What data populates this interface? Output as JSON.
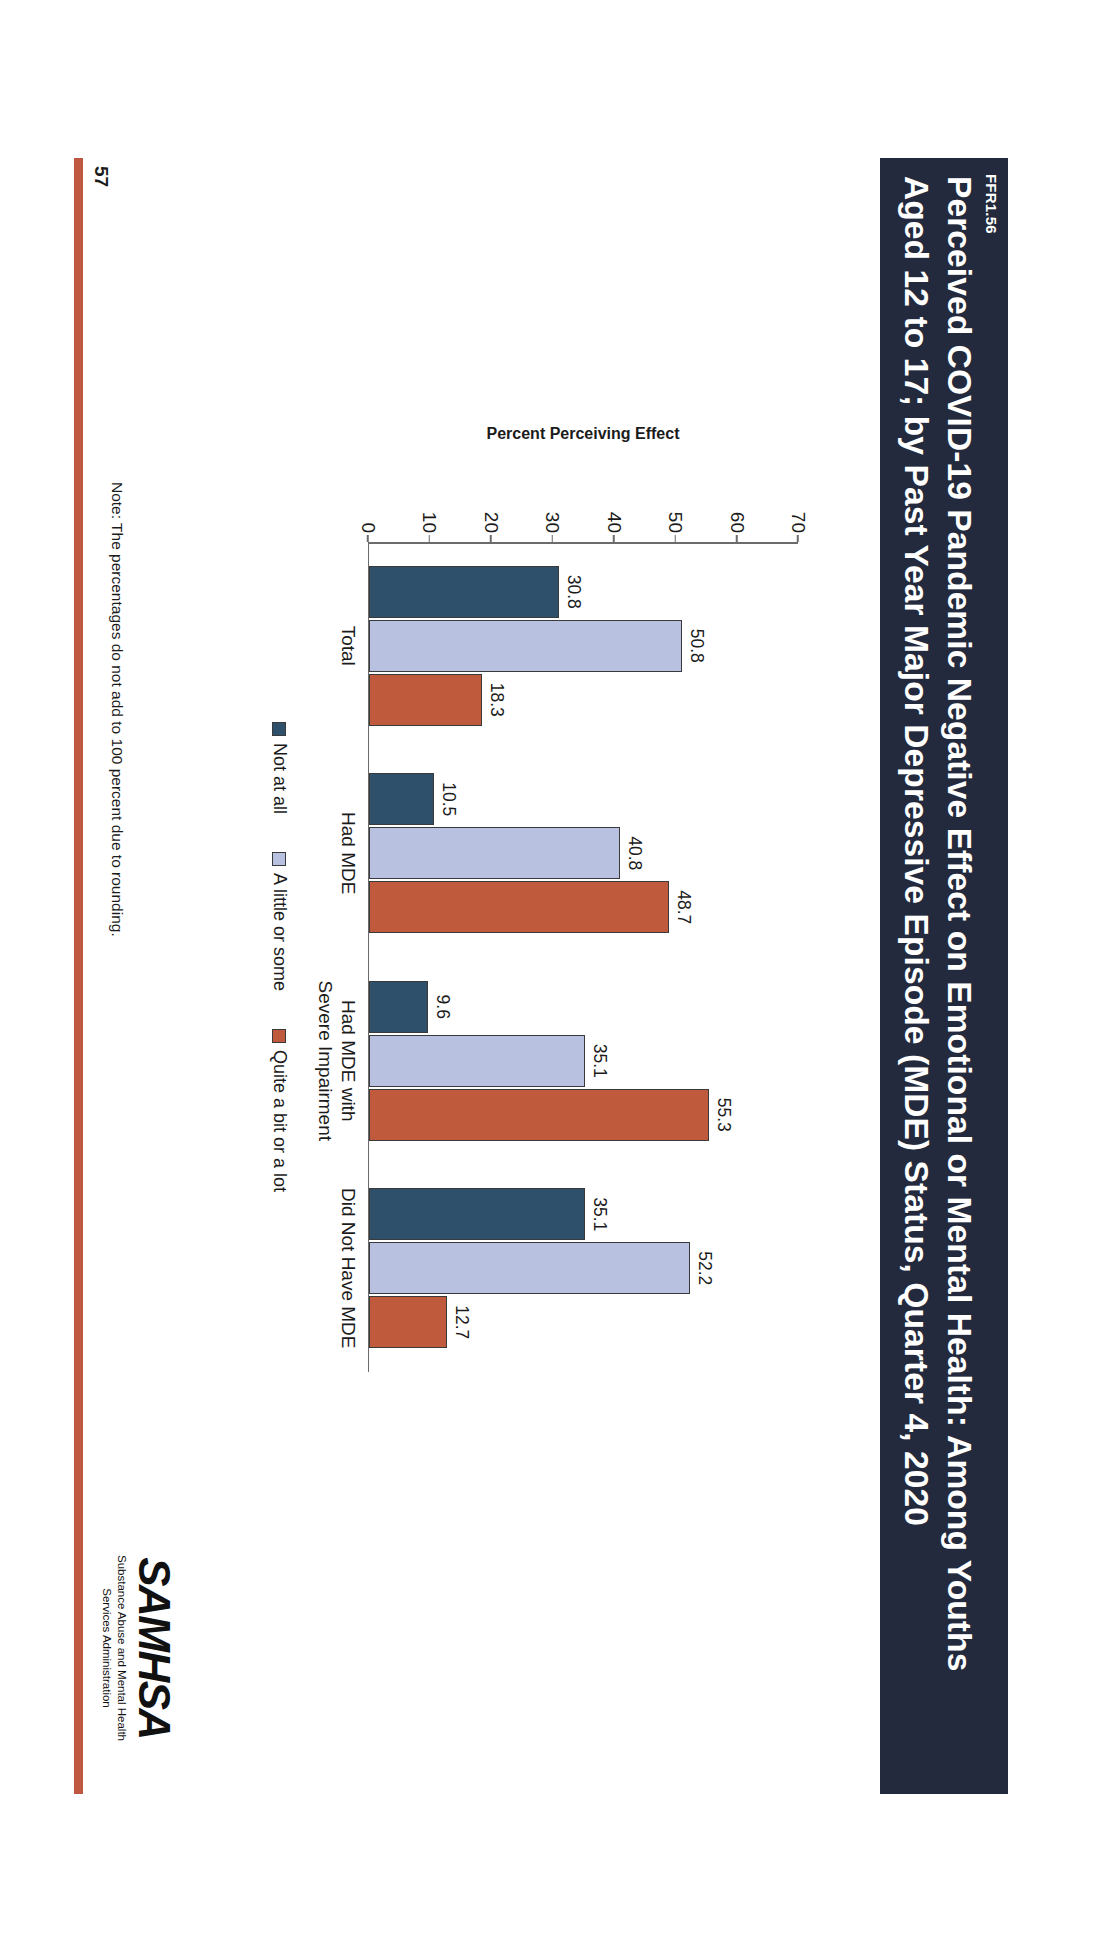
{
  "slide": {
    "ffr_tag": "FFR1.56",
    "title_line1": "Perceived COVID-19 Pandemic Negative Effect on Emotional or Mental Health: Among Youths",
    "title_line2": "Aged 12 to 17; by Past Year Major Depressive Episode (MDE) Status, Quarter 4, 2020",
    "footnote": "Note: The percentages do not add to 100 percent due to rounding.",
    "page_number": "57",
    "band_color": "#232a3d",
    "accent_color": "#bf5840"
  },
  "logo": {
    "wordmark": "SAMHSA",
    "sub_line1": "Substance Abuse and Mental Health",
    "sub_line2": "Services Administration"
  },
  "chart_data": {
    "type": "bar",
    "title": "",
    "xlabel": "",
    "ylabel": "Percent Perceiving Effect",
    "ylim": [
      0,
      70
    ],
    "yticks": [
      0,
      10,
      20,
      30,
      40,
      50,
      60,
      70
    ],
    "grid": false,
    "legend_position": "bottom",
    "categories": [
      "Total",
      "Had MDE",
      "Had MDE with\nSevere Impairment",
      "Did Not Have MDE"
    ],
    "category_labels": [
      {
        "line1": "Total",
        "line2": ""
      },
      {
        "line1": "Had MDE",
        "line2": ""
      },
      {
        "line1": "Had MDE with",
        "line2": "Severe Impairment"
      },
      {
        "line1": "Did Not Have MDE",
        "line2": ""
      }
    ],
    "series": [
      {
        "name": "Not at all",
        "color": "#2f506b",
        "values": [
          30.8,
          10.5,
          9.6,
          35.1
        ],
        "labels": [
          "30.8",
          "10.5",
          "9.6",
          "35.1"
        ]
      },
      {
        "name": "A little or some",
        "color": "#b8c2e0",
        "values": [
          50.8,
          40.8,
          35.1,
          52.2
        ],
        "labels": [
          "50.8",
          "40.8",
          "35.1",
          "52.2"
        ]
      },
      {
        "name": "Quite a bit or a lot",
        "color": "#c05a3c",
        "values": [
          18.3,
          48.7,
          55.3,
          12.7
        ],
        "labels": [
          "18.3",
          "48.7",
          "55.3",
          "12.7"
        ]
      }
    ]
  }
}
